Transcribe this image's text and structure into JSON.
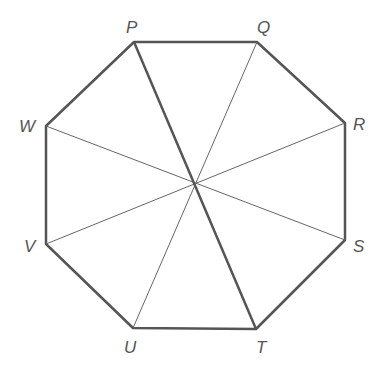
{
  "diagram": {
    "type": "regular octagon with diagonals through center",
    "center": {
      "x": 194,
      "y": 183
    },
    "vertices": [
      {
        "name": "P",
        "x": 134,
        "y": 42,
        "lx": 126,
        "ly": 33
      },
      {
        "name": "Q",
        "x": 257,
        "y": 42,
        "lx": 257,
        "ly": 33
      },
      {
        "name": "R",
        "x": 345,
        "y": 123,
        "lx": 353,
        "ly": 130
      },
      {
        "name": "S",
        "x": 345,
        "y": 240,
        "lx": 353,
        "ly": 252
      },
      {
        "name": "T",
        "x": 256,
        "y": 329,
        "lx": 256,
        "ly": 353
      },
      {
        "name": "U",
        "x": 133,
        "y": 328,
        "lx": 124,
        "ly": 353
      },
      {
        "name": "V",
        "x": 46,
        "y": 244,
        "lx": 24,
        "ly": 252
      },
      {
        "name": "W",
        "x": 46,
        "y": 126,
        "lx": 19,
        "ly": 132
      }
    ],
    "thick_segments": [
      [
        "P",
        "T"
      ]
    ],
    "thin_segments": [
      [
        "Q",
        "U"
      ],
      [
        "R",
        "V"
      ],
      [
        "S",
        "W"
      ]
    ],
    "colors": {
      "stroke": "#555555",
      "label": "#555555"
    }
  }
}
